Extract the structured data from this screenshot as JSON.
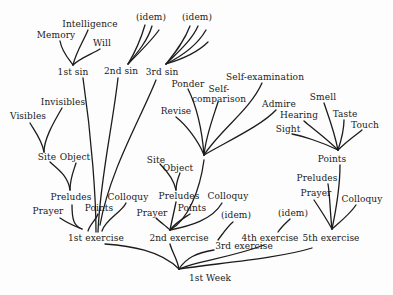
{
  "diagram": {
    "root": "1st Week",
    "nodes": {
      "week": {
        "label": "1st Week",
        "x": 210,
        "y": 278
      },
      "ex1": {
        "label": "1st exercise",
        "x": 96,
        "y": 238
      },
      "ex2": {
        "label": "2nd exercise",
        "x": 179,
        "y": 238
      },
      "ex3": {
        "label": "3rd exercise",
        "x": 244,
        "y": 246
      },
      "ex4": {
        "label": "4th exercise",
        "x": 270,
        "y": 238
      },
      "ex5": {
        "label": "5th exercise",
        "x": 331,
        "y": 238
      },
      "ex3_idem": {
        "label": "(idem)",
        "x": 236,
        "y": 215
      },
      "ex4_idem": {
        "label": "(idem)",
        "x": 293,
        "y": 213
      },
      "ex1_prayer": {
        "label": "Prayer",
        "x": 48,
        "y": 211
      },
      "ex1_preludes": {
        "label": "Preludes",
        "x": 71,
        "y": 197
      },
      "ex1_points": {
        "label": "Points",
        "x": 99,
        "y": 208
      },
      "ex1_colloquy": {
        "label": "Colloquy",
        "x": 128,
        "y": 197
      },
      "ex1_site": {
        "label": "Site",
        "x": 47,
        "y": 157
      },
      "ex1_object": {
        "label": "Object",
        "x": 75,
        "y": 157
      },
      "ex1_visibles": {
        "label": "Visibles",
        "x": 28,
        "y": 116
      },
      "ex1_invisibles": {
        "label": "Invisibles",
        "x": 63,
        "y": 102
      },
      "sin1": {
        "label": "1st sin",
        "x": 73,
        "y": 72
      },
      "sin2": {
        "label": "2nd sin",
        "x": 121,
        "y": 71
      },
      "sin3": {
        "label": "3rd sin",
        "x": 162,
        "y": 72
      },
      "sin1_memory": {
        "label": "Memory",
        "x": 56,
        "y": 35
      },
      "sin1_intelligence": {
        "label": "Intelligence",
        "x": 90,
        "y": 24
      },
      "sin1_will": {
        "label": "Will",
        "x": 102,
        "y": 43
      },
      "sin2_idem": {
        "label": "(idem)",
        "x": 151,
        "y": 17
      },
      "sin3_idem": {
        "label": "(idem)",
        "x": 197,
        "y": 17
      },
      "ex2_prayer": {
        "label": "Prayer",
        "x": 152,
        "y": 213
      },
      "ex2_preludes": {
        "label": "Preludes",
        "x": 179,
        "y": 196
      },
      "ex2_points": {
        "label": "Points",
        "x": 192,
        "y": 208
      },
      "ex2_colloquy": {
        "label": "Colloquy",
        "x": 228,
        "y": 196
      },
      "ex2_site": {
        "label": "Site",
        "x": 156,
        "y": 160
      },
      "ex2_object": {
        "label": "Object",
        "x": 178,
        "y": 168
      },
      "ex2_revise": {
        "label": "Revise",
        "x": 176,
        "y": 111
      },
      "ex2_ponder": {
        "label": "Ponder",
        "x": 188,
        "y": 84
      },
      "ex2_selfcomp": {
        "label": "Self-\ncomparison",
        "x": 219,
        "y": 94
      },
      "ex2_selfexam": {
        "label": "Self-examination",
        "x": 265,
        "y": 77
      },
      "ex2_admire": {
        "label": "Admire",
        "x": 279,
        "y": 104
      },
      "ex5_prayer": {
        "label": "Prayer",
        "x": 316,
        "y": 193
      },
      "ex5_preludes": {
        "label": "Preludes",
        "x": 317,
        "y": 178
      },
      "ex5_colloquy": {
        "label": "Colloquy",
        "x": 362,
        "y": 199
      },
      "ex5_points": {
        "label": "Points",
        "x": 332,
        "y": 159
      },
      "ex5_sight": {
        "label": "Sight",
        "x": 288,
        "y": 129
      },
      "ex5_hearing": {
        "label": "Hearing",
        "x": 299,
        "y": 115
      },
      "ex5_smell": {
        "label": "Smell",
        "x": 323,
        "y": 97
      },
      "ex5_taste": {
        "label": "Taste",
        "x": 345,
        "y": 114
      },
      "ex5_touch": {
        "label": "Touch",
        "x": 365,
        "y": 125
      }
    }
  }
}
